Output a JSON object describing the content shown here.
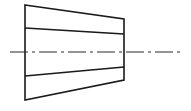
{
  "diagram": {
    "type": "technical-drawing",
    "canvas": {
      "width": 191,
      "height": 111
    },
    "colors": {
      "background": "#ffffff",
      "line": "#1a1a1a",
      "centerline": "#2a2a2a"
    },
    "outline": {
      "points": [
        [
          25,
          5
        ],
        [
          124,
          19
        ],
        [
          124,
          80
        ],
        [
          25,
          100
        ]
      ]
    },
    "inner_lines": [
      {
        "name": "upper-line",
        "x1": 25,
        "y1": 28,
        "x2": 124,
        "y2": 34
      },
      {
        "name": "lower-line",
        "x1": 25,
        "y1": 76,
        "x2": 124,
        "y2": 67
      }
    ],
    "centerline": {
      "x1": 10,
      "y1": 52,
      "x2": 181,
      "y2": 52,
      "dasharray": "18 4 3 4"
    }
  }
}
